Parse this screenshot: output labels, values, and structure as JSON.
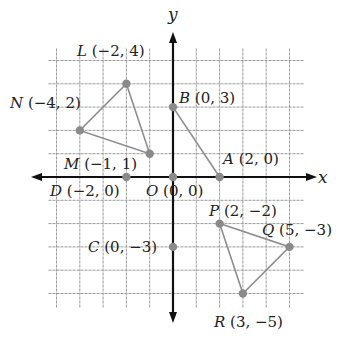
{
  "diagram": {
    "type": "coordinate-plane",
    "axes": {
      "x_label": "x",
      "y_label": "y"
    },
    "grid": {
      "x_range": [
        -5,
        5
      ],
      "y_range": [
        -5,
        5
      ],
      "unit": 1
    },
    "colors": {
      "grid": "#9a9a9a",
      "axis": "#111111",
      "segment": "#8e8e8e",
      "point": "#8a8a8a",
      "text": "#222222"
    },
    "points": [
      {
        "name": "L",
        "x": -2,
        "y": 4,
        "coords": "(−2, 4)"
      },
      {
        "name": "N",
        "x": -4,
        "y": 2,
        "coords": "(−4, 2)"
      },
      {
        "name": "M",
        "x": -1,
        "y": 1,
        "coords": "(−1, 1)"
      },
      {
        "name": "B",
        "x": 0,
        "y": 3,
        "coords": "(0, 3)"
      },
      {
        "name": "A",
        "x": 2,
        "y": 0,
        "coords": "(2, 0)"
      },
      {
        "name": "D",
        "x": -2,
        "y": 0,
        "coords": "(−2, 0)"
      },
      {
        "name": "O",
        "x": 0,
        "y": 0,
        "coords": "(0, 0)"
      },
      {
        "name": "C",
        "x": 0,
        "y": -3,
        "coords": "(0, −3)"
      },
      {
        "name": "P",
        "x": 2,
        "y": -2,
        "coords": "(2, −2)"
      },
      {
        "name": "Q",
        "x": 5,
        "y": -3,
        "coords": "(5, −3)"
      },
      {
        "name": "R",
        "x": 3,
        "y": -5,
        "coords": "(3, −5)"
      }
    ],
    "shapes": [
      {
        "name": "triangle-LMN",
        "vertices": [
          "L",
          "M",
          "N"
        ]
      },
      {
        "name": "segment-BA",
        "vertices": [
          "B",
          "A"
        ]
      },
      {
        "name": "triangle-PQR",
        "vertices": [
          "P",
          "Q",
          "R"
        ]
      }
    ]
  }
}
